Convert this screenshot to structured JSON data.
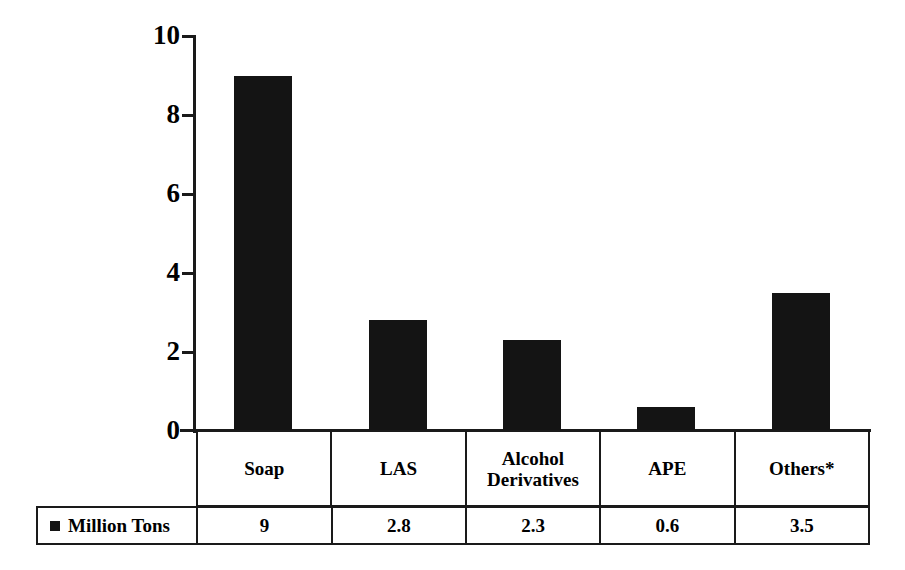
{
  "chart_data": {
    "type": "bar",
    "title": "",
    "subtitle": "",
    "xlabel": "",
    "ylabel": "",
    "categories": [
      "Soap",
      "LAS",
      "Alcohol Derivatives",
      "APE",
      "Others*"
    ],
    "values": [
      9,
      2.8,
      2.3,
      0.6,
      3.5
    ],
    "value_labels": [
      "9",
      "2.8",
      "2.3",
      "0.6",
      "3.5"
    ],
    "series": [
      {
        "name": "Million Tons",
        "values": [
          9,
          2.8,
          2.3,
          0.6,
          3.5
        ]
      }
    ],
    "ylim": [
      0,
      10
    ],
    "yticks": [
      0,
      2,
      4,
      6,
      8,
      10
    ],
    "ytick_labels": [
      "0",
      "2",
      "4",
      "6",
      "8",
      "10"
    ],
    "grid": false,
    "legend_position": "bottom-left-table",
    "legend_entries": [
      "Million Tons"
    ],
    "bar_color": "#141414",
    "axis_color": "#1a1a1a",
    "background_color": "#ffffff",
    "annotations": [
      "*"
    ]
  },
  "axis": {
    "ticks": [
      {
        "label": "10",
        "value": 10
      },
      {
        "label": "8",
        "value": 8
      },
      {
        "label": "6",
        "value": 6
      },
      {
        "label": "4",
        "value": 4
      },
      {
        "label": "2",
        "value": 2
      },
      {
        "label": "0",
        "value": 0
      }
    ]
  },
  "table": {
    "category_row": [
      "Soap",
      "LAS",
      "Alcohol Derivatives",
      "APE",
      "Others*"
    ],
    "legend_label": "Million Tons",
    "legend_marker": "square-marker-icon",
    "value_row": [
      "9",
      "2.8",
      "2.3",
      "0.6",
      "3.5"
    ]
  }
}
